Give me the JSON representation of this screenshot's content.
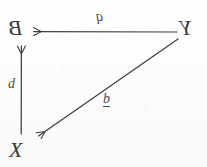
{
  "diagram": {
    "ink_color": "#3f3f3f",
    "paper_color": "#fdfdfd",
    "orientation_note": "scan is horizontally mirrored",
    "nodes": [
      {
        "id": "node-b",
        "text": "B",
        "mirrored": true,
        "x": 20,
        "y": 31
      },
      {
        "id": "node-y",
        "text": "Y",
        "mirrored": true,
        "x": 188,
        "y": 31
      },
      {
        "id": "node-x",
        "text": "X",
        "mirrored": false,
        "x": 20,
        "y": 150
      }
    ],
    "edges": [
      {
        "id": "edge-top",
        "from": "node-y",
        "to": "node-b",
        "label": "q",
        "label_mirrored": true,
        "label_underlined": false,
        "direction": "left"
      },
      {
        "id": "edge-left",
        "from": "node-x",
        "to": "node-b",
        "label": "d",
        "label_mirrored": false,
        "label_underlined": false,
        "direction": "up"
      },
      {
        "id": "edge-diagonal",
        "from": "node-y",
        "to": "node-x",
        "label": "b",
        "label_mirrored": false,
        "label_underlined": true,
        "direction": "down-left"
      }
    ]
  }
}
